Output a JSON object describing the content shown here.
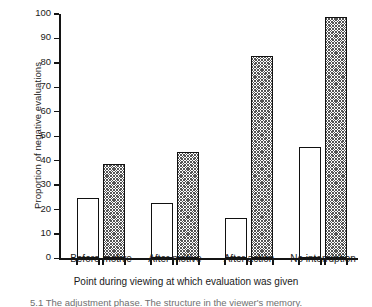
{
  "chart_data": {
    "type": "bar",
    "title": "",
    "xlabel": "Point during viewing at which evaluation was given",
    "ylabel": "Proportion of negative evaluations",
    "categories": [
      "Before motive",
      "After motive",
      "After action",
      "No interruption"
    ],
    "ylim": [
      0,
      100
    ],
    "yticks": [
      0,
      10,
      20,
      30,
      40,
      50,
      60,
      70,
      80,
      90,
      100
    ],
    "grid": false,
    "legend": "none",
    "series": [
      {
        "name": "open",
        "fill": "open",
        "values": [
          24,
          22,
          16,
          45
        ]
      },
      {
        "name": "hatched",
        "fill": "hatched",
        "values": [
          38,
          43,
          82,
          98
        ]
      }
    ]
  },
  "caption": {
    "text": "5.1  The adjustment phase. The structure in the viewer's memory."
  },
  "colors": {
    "ink": "#141414",
    "bar_outline": "#111111",
    "bar_open_fill": "#ffffff",
    "bar_hatch": "#555555",
    "background": "#ffffff"
  }
}
